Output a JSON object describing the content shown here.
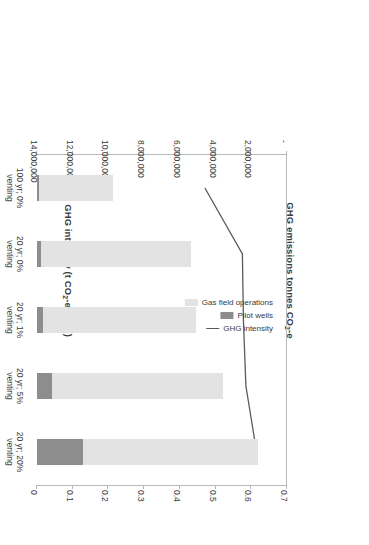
{
  "chart_data": {
    "type": "bar",
    "title": "",
    "orientation": "horizontal",
    "categories": [
      "100 yr; 0% venting",
      "20 yr; 0% venting",
      "20 yr; 1% venting",
      "20 yr; 5% venting",
      "20 yr; 20% venting"
    ],
    "series": [
      {
        "name": "Gas field operations",
        "type": "bar",
        "axis": "primary",
        "color": "#e3e3e3",
        "values": [
          4150000,
          8400000,
          8550000,
          9550000,
          9800000
        ]
      },
      {
        "name": "Pilot wells",
        "type": "bar",
        "axis": "primary",
        "color": "#8d8d8d",
        "values": [
          90000,
          200000,
          350000,
          850000,
          2600000
        ]
      },
      {
        "name": "GHG intensity",
        "type": "line",
        "axis": "secondary",
        "color": "#5a5a5a",
        "values": [
          0.47,
          0.575,
          0.578,
          0.585,
          0.615
        ]
      }
    ],
    "primary_axis": {
      "label": "GHG emissions tonnes CO2-e",
      "ticklabels": [
        "-",
        "2,000,000",
        "4,000,000",
        "6,000,000",
        "8,000,000",
        "10,000,000",
        "12,000,000",
        "14,000,000"
      ],
      "lim": [
        0,
        14000000
      ],
      "grid": false
    },
    "secondary_axis": {
      "label": "GHG intensity (t CO2-e/MWh)",
      "ticklabels": [
        "0",
        "0.1",
        "0.2",
        "0.3",
        "0.4",
        "0.5",
        "0.6",
        "0.7"
      ],
      "lim": [
        0,
        0.7
      ],
      "grid": false
    },
    "legend": {
      "position": "inside-left",
      "entries": [
        {
          "label": "Gas field operations",
          "marker": "swatch",
          "color": "#e3e3e3"
        },
        {
          "label": "Pilot wells",
          "marker": "swatch",
          "color": "#8d8d8d"
        },
        {
          "label": "GHG intensity",
          "marker": "line",
          "color": "#5a5a5a"
        }
      ]
    },
    "xlabel": "GHG emissions tonnes CO2-e",
    "ylabel": "GHG intensity (t CO2-e/MWh)"
  },
  "axis_titles": {
    "primary_prefix": "GHG emissions tonnes CO",
    "primary_sub": "2",
    "primary_suffix": "-e",
    "secondary_prefix": "GHG intensity (t CO",
    "secondary_sub": "2",
    "secondary_suffix": "-e/MWh)"
  }
}
